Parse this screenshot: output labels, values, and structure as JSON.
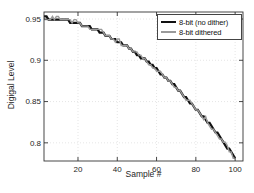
{
  "chart_data": {
    "type": "line",
    "title": "",
    "xlabel": "Sample #",
    "ylabel": "Digigal Level",
    "x_ticks": [
      20,
      40,
      60,
      80,
      100
    ],
    "x_tick_labels": [
      "20",
      "40",
      "60",
      "80",
      "100"
    ],
    "y_ticks": [
      0.95,
      0.9,
      0.85,
      0.8
    ],
    "y_tick_labels": [
      "0.95",
      "0.9",
      "0.85",
      "0.8"
    ],
    "xlim": [
      2.7,
      104
    ],
    "ylim": [
      0.778,
      0.9585
    ],
    "grid": "dotted",
    "legend_position": "top-right",
    "quantization_bits": 8,
    "quantization_step": 0.00390625,
    "signal_x": [
      0,
      5,
      10,
      15,
      20,
      25,
      30,
      35,
      40,
      45,
      50,
      55,
      60,
      65,
      70,
      75,
      80,
      85,
      90,
      95,
      100
    ],
    "signal_y": [
      0.9515,
      0.9511,
      0.9497,
      0.9475,
      0.9445,
      0.9405,
      0.9357,
      0.93,
      0.9235,
      0.9161,
      0.9077,
      0.8988,
      0.889,
      0.8784,
      0.8669,
      0.8547,
      0.8408,
      0.8281,
      0.8136,
      0.7985,
      0.7805
    ],
    "series": [
      {
        "name": "8-bit (no dither)",
        "color": "#111111",
        "width": 2.2,
        "mode": "quantized"
      },
      {
        "name": "8-bit dithered",
        "color": "#9a9a9a",
        "width": 1.4,
        "mode": "dithered"
      }
    ],
    "colors": {
      "background": "#ffffff",
      "axis": "#333333",
      "tick_text": "#262626",
      "grid": "#e0e0e0",
      "legend_border": "#444444"
    }
  }
}
